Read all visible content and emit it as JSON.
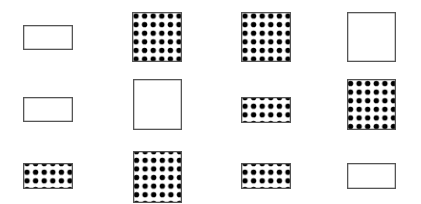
{
  "canvas": {
    "width": 421,
    "height": 204,
    "background": "#ffffff"
  },
  "style": {
    "stroke_color": "#555555",
    "stroke_width": 1.3,
    "dot_color": "#000000",
    "dot_pitch": 8.6,
    "dot_radius": 2.7
  },
  "grid": {
    "rows": 3,
    "columns": 4,
    "cells": [
      {
        "row": 1,
        "col": 1,
        "shape": "rectangle",
        "fill": "empty",
        "x": 23,
        "y": 25,
        "w": 50,
        "h": 25
      },
      {
        "row": 1,
        "col": 2,
        "shape": "square",
        "fill": "dotted",
        "x": 132,
        "y": 12,
        "w": 50,
        "h": 50
      },
      {
        "row": 1,
        "col": 3,
        "shape": "square",
        "fill": "dotted",
        "x": 241,
        "y": 12,
        "w": 50,
        "h": 50
      },
      {
        "row": 1,
        "col": 4,
        "shape": "square",
        "fill": "empty",
        "x": 347,
        "y": 12,
        "w": 49,
        "h": 50
      },
      {
        "row": 2,
        "col": 1,
        "shape": "rectangle",
        "fill": "empty",
        "x": 23,
        "y": 97,
        "w": 50,
        "h": 25
      },
      {
        "row": 2,
        "col": 2,
        "shape": "square",
        "fill": "empty",
        "x": 133,
        "y": 79,
        "w": 49,
        "h": 51
      },
      {
        "row": 2,
        "col": 3,
        "shape": "rectangle",
        "fill": "dotted",
        "x": 241,
        "y": 97,
        "w": 50,
        "h": 26
      },
      {
        "row": 2,
        "col": 4,
        "shape": "square",
        "fill": "dotted",
        "x": 347,
        "y": 79,
        "w": 49,
        "h": 51
      },
      {
        "row": 3,
        "col": 1,
        "shape": "rectangle",
        "fill": "dotted",
        "x": 23,
        "y": 163,
        "w": 50,
        "h": 26
      },
      {
        "row": 3,
        "col": 2,
        "shape": "square",
        "fill": "dotted",
        "x": 133,
        "y": 151,
        "w": 49,
        "h": 52
      },
      {
        "row": 3,
        "col": 3,
        "shape": "rectangle",
        "fill": "dotted",
        "x": 241,
        "y": 163,
        "w": 50,
        "h": 26
      },
      {
        "row": 3,
        "col": 4,
        "shape": "rectangle",
        "fill": "empty",
        "x": 347,
        "y": 163,
        "w": 49,
        "h": 26
      }
    ]
  }
}
